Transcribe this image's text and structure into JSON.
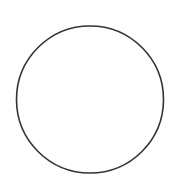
{
  "canvas": {
    "width": 181,
    "height": 194,
    "background": "#ffffff"
  },
  "shapes": [
    {
      "type": "circle",
      "cx": 90,
      "cy": 99.5,
      "r": 73.5,
      "stroke": "#333333",
      "stroke_width": 1.6,
      "fill": "none"
    }
  ]
}
